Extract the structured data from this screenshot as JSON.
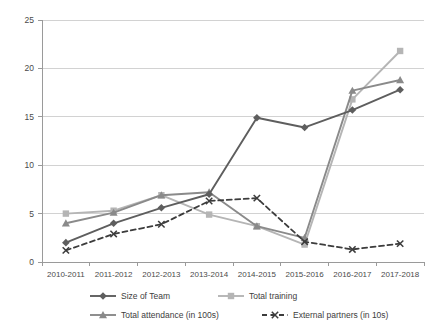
{
  "chart_data": {
    "type": "line",
    "title": "",
    "xlabel": "",
    "ylabel": "",
    "ylim": [
      0,
      25
    ],
    "yticks": [
      0,
      5,
      10,
      15,
      20,
      25
    ],
    "grid": true,
    "legend_position": "bottom",
    "categories": [
      "2010-2011",
      "2011-2012",
      "2012-2013",
      "2013-2014",
      "2014-2015",
      "2015-2016",
      "2016-2017",
      "2017-2018"
    ],
    "series": [
      {
        "name": "Size of Team",
        "color": "#5e5e5e",
        "marker": "diamond",
        "dash": "solid",
        "values": [
          2.0,
          4.0,
          5.6,
          7.0,
          14.9,
          13.9,
          15.7,
          17.8
        ]
      },
      {
        "name": "Total training",
        "color": "#b5b5b5",
        "marker": "square",
        "dash": "solid",
        "values": [
          5.0,
          5.3,
          6.9,
          4.9,
          3.7,
          1.8,
          16.8,
          21.8
        ]
      },
      {
        "name": "Total attendance  (in 100s)",
        "color": "#8a8a8a",
        "marker": "triangle",
        "dash": "solid",
        "values": [
          4.0,
          5.1,
          6.9,
          7.2,
          3.7,
          2.5,
          17.7,
          18.8
        ]
      },
      {
        "name": "External partners (in 10s)",
        "color": "#3c3c3c",
        "marker": "x",
        "dash": "dashed",
        "values": [
          1.2,
          2.9,
          3.9,
          6.3,
          6.6,
          2.1,
          1.3,
          1.9
        ]
      }
    ]
  },
  "legend": {
    "items": [
      {
        "label": "Size of Team"
      },
      {
        "label": "Total training"
      },
      {
        "label": "Total attendance  (in 100s)"
      },
      {
        "label": "External partners (in 10s)"
      }
    ]
  }
}
